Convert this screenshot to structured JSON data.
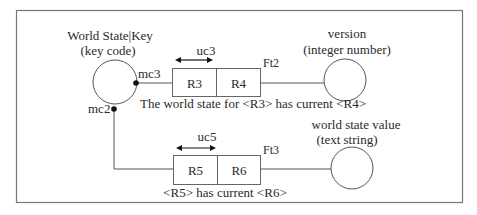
{
  "diagram": {
    "entities": {
      "key": {
        "name": "World State|Key",
        "type": "(key code)"
      },
      "version": {
        "name": "version",
        "type": "(integer number)"
      },
      "value": {
        "name": "world state value",
        "type": "(text string)"
      }
    },
    "facts": [
      {
        "id": "Ft2",
        "roles": [
          "R3",
          "R4"
        ],
        "uniqueness": "uc3",
        "reading": "The world state for <R3> has current <R4>",
        "mandatory": "mc3"
      },
      {
        "id": "Ft3",
        "roles": [
          "R5",
          "R6"
        ],
        "uniqueness": "uc5",
        "reading": "<R5> has current <R6>",
        "mandatory": "mc2"
      }
    ]
  }
}
